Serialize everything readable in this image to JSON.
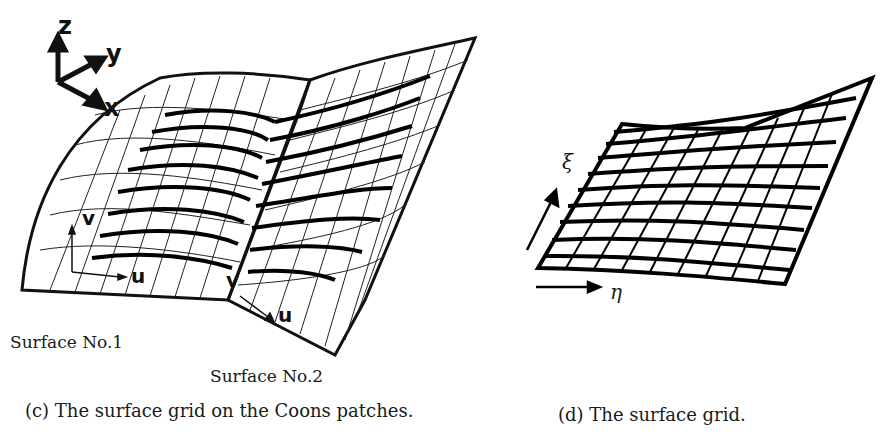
{
  "figure_c": {
    "axes": {
      "z": "z",
      "y": "y",
      "x": "x"
    },
    "param_labels_surface1": {
      "v": "v",
      "u": "u"
    },
    "param_labels_surface2": {
      "v": "v",
      "u": "u"
    },
    "surface1_label": "Surface No.1",
    "surface2_label": "Surface No.2",
    "caption": "(c) The surface grid on the Coons patches."
  },
  "figure_d": {
    "xi_label": "ξ",
    "eta_label": "η",
    "caption": "(d) The surface grid."
  }
}
